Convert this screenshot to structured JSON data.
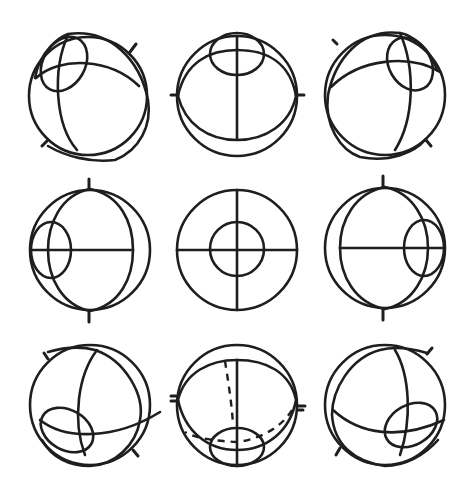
{
  "figure": {
    "title": "",
    "ink_color": "#1e1e1e",
    "background": "#ffffff",
    "layout": {
      "rows": 3,
      "cols": 3
    },
    "panels": [
      {
        "id": "up-left",
        "row": 0,
        "col": 0,
        "center": [
          88,
          95
        ],
        "radius": 59,
        "gaze": "up-left"
      },
      {
        "id": "up",
        "row": 0,
        "col": 1,
        "center": [
          237,
          95
        ],
        "radius": 60,
        "gaze": "up"
      },
      {
        "id": "up-right",
        "row": 0,
        "col": 2,
        "center": [
          385,
          93
        ],
        "radius": 60,
        "gaze": "up-right"
      },
      {
        "id": "left",
        "row": 1,
        "col": 0,
        "center": [
          90,
          250
        ],
        "radius": 60,
        "gaze": "left"
      },
      {
        "id": "primary",
        "row": 1,
        "col": 1,
        "center": [
          237,
          250
        ],
        "radius": 60,
        "gaze": "straight-ahead"
      },
      {
        "id": "right",
        "row": 1,
        "col": 2,
        "center": [
          385,
          248
        ],
        "radius": 60,
        "gaze": "right"
      },
      {
        "id": "down-left",
        "row": 2,
        "col": 0,
        "center": [
          90,
          405
        ],
        "radius": 60,
        "gaze": "down-left"
      },
      {
        "id": "down",
        "row": 2,
        "col": 1,
        "center": [
          237,
          405
        ],
        "radius": 60,
        "gaze": "down"
      },
      {
        "id": "down-right",
        "row": 2,
        "col": 2,
        "center": [
          385,
          405
        ],
        "radius": 60,
        "gaze": "down-right"
      }
    ]
  }
}
